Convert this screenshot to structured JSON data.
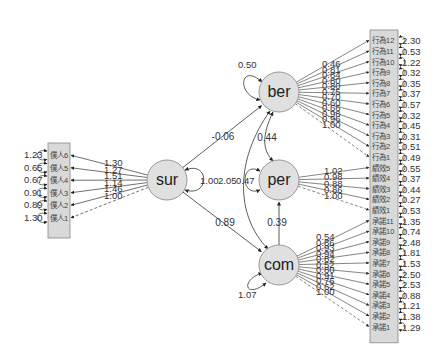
{
  "diagram": {
    "type": "SEM path diagram",
    "colors": {
      "latent_fill": "#e0e0e0",
      "latent_stroke": "#999999",
      "indicator_fill": "#d9d9d9",
      "line": "#333333"
    },
    "latents": [
      {
        "id": "sur",
        "label": "sur",
        "variance": "1.00"
      },
      {
        "id": "ber",
        "label": "ber",
        "variance": "0.50"
      },
      {
        "id": "per",
        "label": "per",
        "variance": "0.47"
      },
      {
        "id": "com",
        "label": "com",
        "variance": "1.07"
      }
    ],
    "structural_paths": [
      {
        "from": "sur",
        "to": "ber",
        "label": "-0.06"
      },
      {
        "from": "sur",
        "to": "com",
        "label": "0.89"
      },
      {
        "from": "com",
        "to": "per",
        "label": "0.39"
      },
      {
        "from": "ber",
        "to": "per",
        "label": "0.44"
      },
      {
        "from": "sur",
        "to": "per",
        "label": "2.05"
      }
    ],
    "sur_block": {
      "indicators": [
        "僕人6",
        "僕人5",
        "僕人4",
        "僕人3",
        "僕人2",
        "僕人1"
      ],
      "loadings": [
        "1.30",
        "1.27",
        "1.51",
        "1.14",
        "1.46",
        "1.00"
      ],
      "errors": [
        "1.23",
        "0.65",
        "0.67",
        "0.91",
        "0.89",
        "1.30"
      ]
    },
    "ber_block": {
      "indicators": [
        "行為12",
        "行為11",
        "行為10",
        "行為9",
        "行為8",
        "行為7",
        "行為6",
        "行為5",
        "行為4",
        "行為3",
        "行為2",
        "行為1"
      ],
      "loadings": [
        "0.46",
        "0.81",
        "0.84",
        "0.80",
        "0.80",
        "0.75",
        "0.70",
        "0.60",
        "0.66",
        "0.98",
        "0.96",
        "1.00"
      ],
      "errors": [
        "2.30",
        "0.53",
        "1.22",
        "0.32",
        "0.35",
        "0.37",
        "0.57",
        "0.32",
        "0.45",
        "0.31",
        "0.51",
        "0.49"
      ]
    },
    "per_block": {
      "indicators": [
        "績效5",
        "績效4",
        "績效3",
        "績效2",
        "績效1"
      ],
      "loadings": [
        "1.02",
        "0.98",
        "0.88",
        "0.86",
        "1.00"
      ],
      "errors": [
        "0.55",
        "0.37",
        "0.44",
        "0.27",
        "0.53"
      ]
    },
    "com_block": {
      "indicators": [
        "承諾11",
        "承諾10",
        "承諾9",
        "承諾8",
        "承諾7",
        "承諾6",
        "承諾5",
        "承諾4",
        "承諾3",
        "承諾2",
        "承諾1"
      ],
      "loadings": [
        "0.54",
        "0.86",
        "0.93",
        "0.94",
        "0.82",
        "0.52",
        "0.80",
        "0.91",
        "0.76",
        "0.62",
        "1.00"
      ],
      "errors": [
        "1.35",
        "0.74",
        "2.48",
        "1.81",
        "1.53",
        "2.50",
        "2.53",
        "0.88",
        "1.21",
        "1.38",
        "1.29"
      ]
    }
  }
}
